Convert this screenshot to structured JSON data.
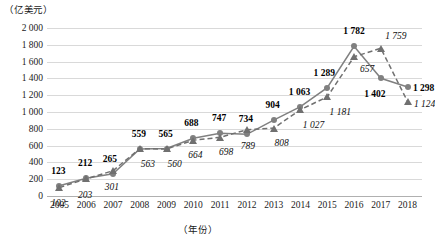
{
  "axis": {
    "unit_label": "（亿美元）",
    "x_title": "（年份）",
    "y_ticks": [
      "2 000",
      "1 800",
      "1 600",
      "1 400",
      "1 200",
      "1 000",
      "800",
      "600",
      "400",
      "200",
      "0"
    ]
  },
  "colors": {
    "series_a": "#808080",
    "series_b": "#707070",
    "grid": "#d9d9d9",
    "text": "#1a1a1a"
  },
  "chart_data": {
    "type": "line",
    "title": "",
    "xlabel": "（年份）",
    "ylabel": "（亿美元）",
    "ylim": [
      0,
      2000
    ],
    "ytick_step": 200,
    "grid": true,
    "legend": "none",
    "categories": [
      "2005",
      "2006",
      "2007",
      "2008",
      "2009",
      "2010",
      "2011",
      "2012",
      "2013",
      "2014",
      "2015",
      "2016",
      "2017",
      "2018"
    ],
    "series": [
      {
        "name": "series-a",
        "marker": "circle",
        "linestyle": "solid",
        "label_style": "bold",
        "values": [
          123,
          212,
          265,
          559,
          565,
          688,
          747,
          734,
          904,
          1063,
          1289,
          1782,
          1402,
          1298
        ],
        "labels": [
          "123",
          "212",
          "265",
          "559",
          "565",
          "688",
          "747",
          "734",
          "904",
          "1 063",
          "1 289",
          "1 782",
          "1 402",
          "1 298"
        ]
      },
      {
        "name": "series-b",
        "marker": "triangle",
        "linestyle": "dashed",
        "label_style": "italic",
        "values": [
          102,
          203,
          301,
          563,
          560,
          664,
          698,
          789,
          808,
          1027,
          1181,
          1657,
          1759,
          1124
        ],
        "labels": [
          "102",
          "203",
          "301",
          "563",
          "560",
          "664",
          "698",
          "789",
          "808",
          "1 027",
          "1 181",
          "657",
          "1 759",
          "1 124"
        ]
      }
    ]
  }
}
